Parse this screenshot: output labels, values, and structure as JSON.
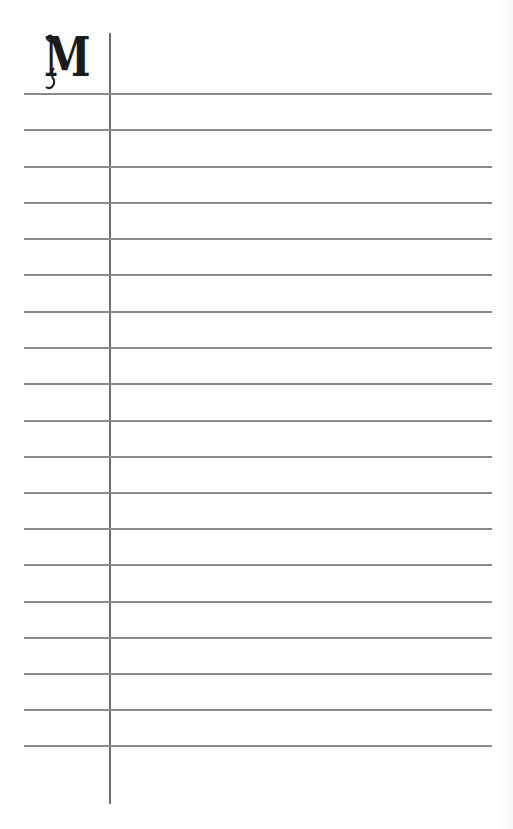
{
  "page": {
    "type": "lined-notepad",
    "monogram_letter": "M",
    "rule_count": 19,
    "rules_top_px": [
      93,
      129,
      166,
      202,
      238,
      274,
      311,
      347,
      383,
      420,
      456,
      492,
      528,
      564,
      601,
      637,
      673,
      709,
      745
    ],
    "colors": {
      "background": "#ffffff",
      "rule": "#8a8a8a",
      "margin_line": "#6e6e6e",
      "monogram": "#1a1a1a"
    }
  }
}
